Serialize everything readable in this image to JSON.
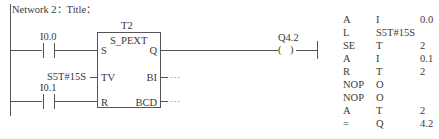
{
  "network": {
    "header": "Network 2：Title："
  },
  "ladder": {
    "contact_1": {
      "address": "I0.0"
    },
    "contact_2": {
      "address": "I0.1"
    },
    "timer": {
      "name": "T2",
      "type": "S_PEXT",
      "inputs": {
        "s": "S",
        "tv": "TV",
        "r": "R"
      },
      "outputs": {
        "q": "Q",
        "bi": "BI",
        "bcd": "BCD"
      },
      "tv_value": "S5T#15S",
      "unconnected_marker": "···"
    },
    "coil": {
      "address": "Q4.2",
      "symbol": "( )"
    }
  },
  "stl": {
    "rows": [
      {
        "op": "A",
        "operand": "I",
        "addr": "0.0"
      },
      {
        "op": "L",
        "operand": "S5T#15S",
        "addr": ""
      },
      {
        "op": "SE",
        "operand": "T",
        "addr": "2"
      },
      {
        "op": "A",
        "operand": "I",
        "addr": "0.1"
      },
      {
        "op": "R",
        "operand": "T",
        "addr": "2"
      },
      {
        "op": "NOP",
        "operand": "O",
        "addr": ""
      },
      {
        "op": "NOP",
        "operand": "O",
        "addr": ""
      },
      {
        "op": "A",
        "operand": "T",
        "addr": "2"
      },
      {
        "op": "=",
        "operand": "Q",
        "addr": "4.2"
      }
    ]
  }
}
